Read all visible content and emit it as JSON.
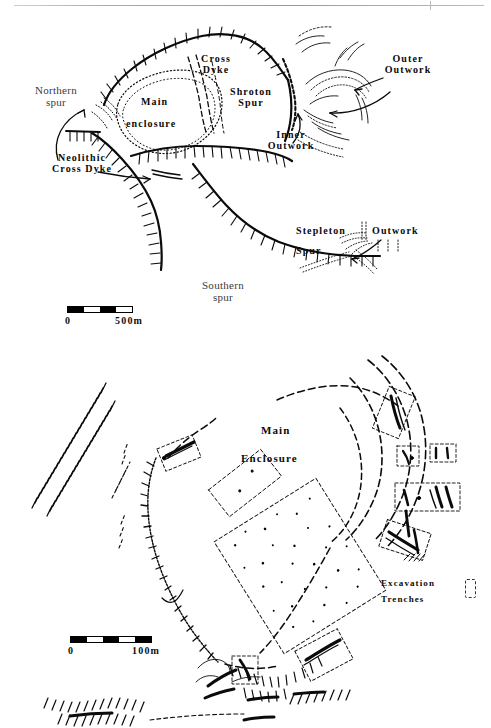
{
  "page": {
    "width": 491,
    "height": 724,
    "background": "#ffffff",
    "ink": "#0b0b0b"
  },
  "figure": {
    "kind": "archaeological-site-plan",
    "panels": [
      {
        "id": "upper",
        "name": "overall-site-plan",
        "labels": [
          {
            "id": "northern-spur",
            "text": "Northern\nspur",
            "style": "plain",
            "x": 24,
            "y": 86,
            "size": 11
          },
          {
            "id": "cross-dyke",
            "text": "Cross\nDyke",
            "style": "bold",
            "x": 198,
            "y": 56,
            "size": 10
          },
          {
            "id": "shroton-spur",
            "text": "Shroton\nSpur",
            "style": "bold",
            "x": 224,
            "y": 88,
            "size": 10
          },
          {
            "id": "main-enclosure",
            "text": "Main",
            "style": "bold",
            "x": 143,
            "y": 100,
            "size": 10
          },
          {
            "id": "main-enclosure2",
            "text": "enclosure",
            "style": "bold",
            "x": 131,
            "y": 120,
            "size": 10
          },
          {
            "id": "outer-outwork",
            "text": "Outer\nOutwork",
            "style": "bold",
            "x": 369,
            "y": 58,
            "size": 10
          },
          {
            "id": "inner-outwork",
            "text": "Inner\nOutwork",
            "style": "bold",
            "x": 255,
            "y": 131,
            "size": 10
          },
          {
            "id": "neolithic-cross-dyke",
            "text": "Neolithic\nCross Dyke",
            "style": "bold",
            "x": 26,
            "y": 155,
            "size": 10
          },
          {
            "id": "stepleton-spur",
            "text": "Stepleton",
            "style": "bold",
            "x": 298,
            "y": 228,
            "size": 10
          },
          {
            "id": "stepleton-spur2",
            "text": "Spur",
            "style": "bold",
            "x": 298,
            "y": 247,
            "size": 10
          },
          {
            "id": "stepleton-outwork",
            "text": "Outwork",
            "style": "bold",
            "x": 370,
            "y": 228,
            "size": 10
          },
          {
            "id": "southern-spur",
            "text": "Southern\nspur",
            "style": "plain",
            "x": 190,
            "y": 281,
            "size": 11
          }
        ],
        "scale": {
          "zero_label": "0",
          "max_label": "500m",
          "segments": [
            "dark",
            "light",
            "dark",
            "light"
          ],
          "x": 67,
          "y": 306,
          "width": 66
        }
      },
      {
        "id": "lower",
        "name": "main-enclosure-detail-plan",
        "labels": [
          {
            "id": "main-enclosure-title",
            "text": "Main",
            "style": "bold",
            "x": 262,
            "y": 429,
            "size": 11
          },
          {
            "id": "main-enclosure-title2",
            "text": "Enclosure",
            "style": "bold",
            "x": 245,
            "y": 456,
            "size": 11
          },
          {
            "id": "excavation-trenches",
            "text": "Excavation",
            "style": "bold",
            "x": 383,
            "y": 580,
            "size": 9
          },
          {
            "id": "excavation-trenches2",
            "text": "Trenches",
            "style": "bold",
            "x": 383,
            "y": 597,
            "size": 9
          }
        ],
        "legend": {
          "symbol": "dashed-rectangle",
          "label": "Excavation Trenches",
          "x": 466,
          "y": 578
        },
        "scale": {
          "zero_label": "0",
          "max_label": "100m",
          "segments": [
            "dark",
            "light",
            "dark",
            "light",
            "dark"
          ],
          "x": 70,
          "y": 636,
          "width": 82
        }
      }
    ],
    "map_features": {
      "rampart_style": "hachured-line",
      "dyke_style": "dashed-line",
      "trench_style": "dashed-rectangle",
      "contour_style": "fine-dotted-line"
    }
  }
}
